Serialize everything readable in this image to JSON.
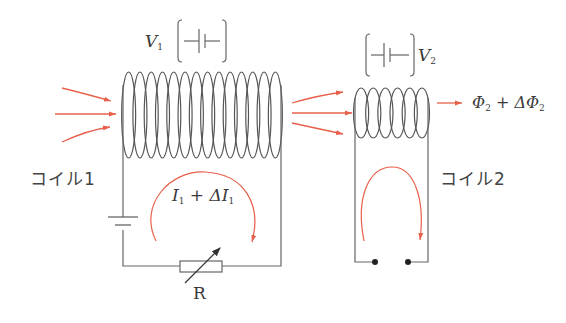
{
  "colors": {
    "wire": "#555555",
    "flux": "#e8604c",
    "text": "#3a3a3a"
  },
  "coil1": {
    "label": "コイル1",
    "voltage_symbol": "V",
    "voltage_sub": "1",
    "loops": 14,
    "current_label_main": "I",
    "current_label_sub": "1",
    "current_label_plus": " + ΔI",
    "current_label_sub2": "1"
  },
  "coil2": {
    "label": "コイル2",
    "voltage_symbol": "V",
    "voltage_sub": "2",
    "loops": 6,
    "flux_label_main": "Φ",
    "flux_label_sub": "2",
    "flux_label_plus": " + ΔΦ",
    "flux_label_sub2": "2"
  },
  "resistor": {
    "label": "R"
  }
}
